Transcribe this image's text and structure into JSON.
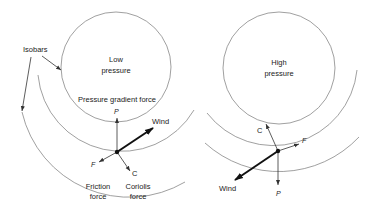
{
  "diagram": {
    "low": {
      "center_label_line1": "Low",
      "center_label_line2": "pressure",
      "pgf_label": "Pressure gradient force",
      "vectors": {
        "p": "P",
        "wind": "Wind",
        "f": "F",
        "c": "C"
      },
      "friction_line1": "Friction",
      "friction_line2": "force",
      "coriolis_line1": "Coriolis",
      "coriolis_line2": "force"
    },
    "high": {
      "center_label_line1": "High",
      "center_label_line2": "pressure",
      "vectors": {
        "p": "P",
        "wind": "Wind",
        "f": "F",
        "c": "C"
      }
    },
    "isobars_label": "Isobars"
  }
}
